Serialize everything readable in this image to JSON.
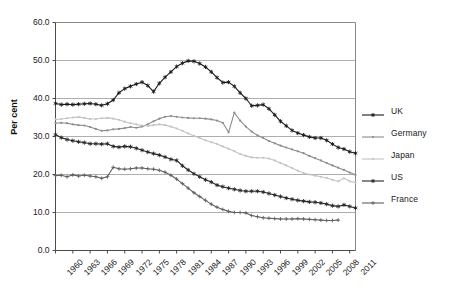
{
  "chart_data": {
    "type": "line",
    "title": "",
    "xlabel": "",
    "ylabel": "Per cent",
    "ylim": [
      0,
      60
    ],
    "ytick_labels": [
      "0.0",
      "10.0",
      "20.0",
      "30.0",
      "40.0",
      "50.0",
      "60.0"
    ],
    "ytick_values": [
      0,
      10,
      20,
      30,
      40,
      50,
      60
    ],
    "grid": "horizontal",
    "legend_position": "right",
    "xlim": [
      1960,
      2012
    ],
    "xtick_labels": [
      "1960",
      "1963",
      "1966",
      "1969",
      "1972",
      "1975",
      "1978",
      "1981",
      "1984",
      "1987",
      "1990",
      "1993",
      "1996",
      "1999",
      "2002",
      "2005",
      "2008",
      "2011"
    ],
    "x": [
      1960,
      1961,
      1962,
      1963,
      1964,
      1965,
      1966,
      1967,
      1968,
      1969,
      1970,
      1971,
      1972,
      1973,
      1974,
      1975,
      1976,
      1977,
      1978,
      1979,
      1980,
      1981,
      1982,
      1983,
      1984,
      1985,
      1986,
      1987,
      1988,
      1989,
      1990,
      1991,
      1992,
      1993,
      1994,
      1995,
      1996,
      1997,
      1998,
      1999,
      2000,
      2001,
      2002,
      2003,
      2004,
      2005,
      2006,
      2007,
      2008,
      2009,
      2010,
      2011,
      2012
    ],
    "series": [
      {
        "name": "UK",
        "color": "#1a1a1a",
        "marker": "asterisk",
        "values": [
          38.7,
          38.4,
          38.5,
          38.4,
          38.5,
          38.6,
          38.7,
          38.5,
          38.2,
          38.6,
          39.6,
          41.5,
          42.6,
          43.2,
          43.8,
          44.3,
          43.4,
          41.8,
          44.0,
          45.6,
          47.0,
          48.4,
          49.3,
          49.9,
          49.8,
          49.2,
          48.3,
          47.0,
          45.5,
          44.2,
          44.3,
          43.2,
          41.5,
          40.0,
          38.1,
          38.2,
          38.4,
          37.3,
          35.7,
          34.0,
          32.8,
          31.6,
          30.9,
          30.4,
          29.9,
          29.6,
          29.6,
          29.0,
          28.0,
          27.1,
          26.7,
          26.0,
          25.6
        ]
      },
      {
        "name": "Germany",
        "color": "#8c8c8c",
        "marker": "dot",
        "values": [
          33.5,
          33.6,
          33.5,
          33.2,
          33.0,
          32.9,
          32.5,
          32.0,
          31.5,
          31.6,
          31.9,
          32.0,
          32.2,
          32.5,
          32.3,
          32.6,
          33.2,
          34.0,
          34.7,
          35.2,
          35.4,
          35.2,
          35.0,
          34.9,
          34.8,
          34.8,
          34.7,
          34.5,
          34.2,
          33.6,
          31.1,
          36.3,
          34.2,
          32.6,
          31.3,
          30.3,
          29.6,
          28.8,
          28.2,
          27.6,
          27.1,
          26.6,
          26.1,
          25.6,
          24.9,
          24.3,
          23.7,
          23.0,
          22.4,
          21.8,
          21.2,
          20.5,
          19.9
        ]
      },
      {
        "name": "Japan",
        "color": "#c3c3c3",
        "marker": "dot",
        "values": [
          34.5,
          34.6,
          34.8,
          35.0,
          35.1,
          34.9,
          34.6,
          34.6,
          34.8,
          34.9,
          34.7,
          34.4,
          33.9,
          33.5,
          33.2,
          32.9,
          32.8,
          33.0,
          33.2,
          33.0,
          32.6,
          32.1,
          31.5,
          30.8,
          30.2,
          29.6,
          29.0,
          28.5,
          28.0,
          27.4,
          26.8,
          26.1,
          25.4,
          24.9,
          24.5,
          24.4,
          24.4,
          24.2,
          23.7,
          23.0,
          22.4,
          21.7,
          21.0,
          20.4,
          20.0,
          19.7,
          19.4,
          19.1,
          18.6,
          18.2,
          19.0,
          18.2,
          17.9
        ]
      },
      {
        "name": "US",
        "color": "#262626",
        "marker": "asterisk",
        "values": [
          30.5,
          29.7,
          29.2,
          28.9,
          28.6,
          28.4,
          28.1,
          28.1,
          28.0,
          28.1,
          27.4,
          27.2,
          27.4,
          27.3,
          26.9,
          26.4,
          25.9,
          25.5,
          25.1,
          24.6,
          24.0,
          23.7,
          22.3,
          21.2,
          20.2,
          19.4,
          18.6,
          18.0,
          17.2,
          16.8,
          16.4,
          16.1,
          15.8,
          15.6,
          15.6,
          15.6,
          15.4,
          15.0,
          14.6,
          14.2,
          13.8,
          13.5,
          13.2,
          13.0,
          12.8,
          12.7,
          12.5,
          12.2,
          11.8,
          11.6,
          12.0,
          11.6,
          11.2
        ]
      },
      {
        "name": "France",
        "color": "#5f5f5f",
        "marker": "plus",
        "values": [
          19.7,
          19.8,
          19.4,
          19.9,
          19.6,
          19.8,
          19.6,
          19.4,
          19.0,
          19.4,
          21.9,
          21.5,
          21.4,
          21.5,
          21.7,
          21.7,
          21.5,
          21.4,
          21.1,
          20.6,
          19.8,
          18.8,
          17.6,
          16.4,
          15.2,
          14.2,
          13.2,
          12.2,
          11.4,
          10.8,
          10.3,
          10.0,
          10.0,
          9.9,
          9.2,
          8.9,
          8.6,
          8.5,
          8.4,
          8.3,
          8.3,
          8.3,
          8.4,
          8.3,
          8.2,
          8.1,
          8.0,
          7.9,
          7.9,
          8.0,
          null,
          null,
          null
        ]
      }
    ]
  },
  "legend": {
    "items": [
      {
        "label": "UK"
      },
      {
        "label": "Germany"
      },
      {
        "label": "Japan"
      },
      {
        "label": "US"
      },
      {
        "label": "France"
      }
    ]
  },
  "axes": {
    "y_axis_title": "Per cent"
  }
}
